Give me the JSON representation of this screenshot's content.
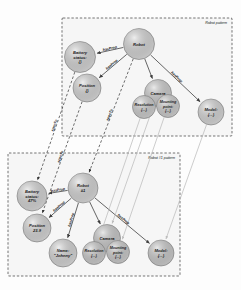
{
  "diagram": {
    "type": "graph",
    "title": "",
    "containers": [
      {
        "id": "pattern-robot",
        "label": "Robot pattern"
      },
      {
        "id": "pattern-robot1",
        "label": "Robot #1 pattern"
      }
    ],
    "nodes": [
      {
        "id": "robot",
        "container": "pattern-robot",
        "lines": [
          "Robot"
        ],
        "cx": 139,
        "cy": 44,
        "r": 15.5,
        "fill": "#d9d9d9"
      },
      {
        "id": "battery",
        "container": "pattern-robot",
        "lines": [
          "Battery",
          "status:",
          "{}"
        ],
        "cx": 80,
        "cy": 57,
        "r": 15.5,
        "fill": "#d9d9d9"
      },
      {
        "id": "position",
        "container": "pattern-robot",
        "lines": [
          "Position",
          "{}"
        ],
        "cx": 87,
        "cy": 88,
        "r": 14.0,
        "fill": "#d9d9d9"
      },
      {
        "id": "camera",
        "container": "pattern-robot",
        "lines": [
          "Camera"
        ],
        "cx": 158,
        "cy": 93,
        "r": 13.5,
        "fill": "#d0d0d0"
      },
      {
        "id": "resolution",
        "container": "pattern-robot",
        "lines": [
          "Resolution",
          "{...}"
        ],
        "cx": 144,
        "cy": 107,
        "r": 11.5,
        "fill": "#d0d0d0"
      },
      {
        "id": "mounting",
        "container": "pattern-robot",
        "lines": [
          "Mounting",
          "point:",
          "{...}"
        ],
        "cx": 168,
        "cy": 106,
        "r": 11.5,
        "fill": "#d0d0d0"
      },
      {
        "id": "model",
        "container": "pattern-robot",
        "lines": [
          "Model:",
          "{...}"
        ],
        "cx": 211,
        "cy": 112,
        "r": 13.0,
        "fill": "#d9d9d9"
      },
      {
        "id": "robot1",
        "container": "pattern-robot1",
        "lines": [
          "Robot",
          "#1"
        ],
        "cx": 83,
        "cy": 188,
        "r": 15.0,
        "fill": "#d9d9d9"
      },
      {
        "id": "battery1",
        "container": "pattern-robot1",
        "lines": [
          "Battery",
          "status:",
          "47%"
        ],
        "cx": 32,
        "cy": 196,
        "r": 15.0,
        "fill": "#d9d9d9"
      },
      {
        "id": "position1",
        "container": "pattern-robot1",
        "lines": [
          "Position",
          "23.9"
        ],
        "cx": 37,
        "cy": 228,
        "r": 14.0,
        "fill": "#d9d9d9"
      },
      {
        "id": "name1",
        "container": "pattern-robot1",
        "lines": [
          "Name:",
          "\"Johnny\""
        ],
        "cx": 63,
        "cy": 253,
        "r": 14.0,
        "fill": "#d9d9d9"
      },
      {
        "id": "camera1",
        "container": "pattern-robot1",
        "lines": [
          "Camera"
        ],
        "cx": 107,
        "cy": 238,
        "r": 13.5,
        "fill": "#cdcdcd"
      },
      {
        "id": "resolution1",
        "container": "pattern-robot1",
        "lines": [
          "Resolution",
          "{...}"
        ],
        "cx": 94,
        "cy": 253,
        "r": 11.5,
        "fill": "#cdcdcd"
      },
      {
        "id": "mounting1",
        "container": "pattern-robot1",
        "lines": [
          "Mounting",
          "point:",
          "{...}"
        ],
        "cx": 118,
        "cy": 252,
        "r": 11.5,
        "fill": "#cdcdcd"
      },
      {
        "id": "model1",
        "container": "pattern-robot1",
        "lines": [
          "Model:",
          "{...}"
        ],
        "cx": 161,
        "cy": 253,
        "r": 13.0,
        "fill": "#cdcdcd"
      }
    ],
    "edges": [
      {
        "from": "robot",
        "to": "battery",
        "label": "hasProp",
        "style": "solid"
      },
      {
        "from": "robot",
        "to": "position",
        "label": "hasProp",
        "style": "solid"
      },
      {
        "from": "robot",
        "to": "camera",
        "label": "",
        "style": "solid"
      },
      {
        "from": "robot",
        "to": "model",
        "label": "hasProp",
        "style": "solid"
      },
      {
        "from": "camera",
        "to": "resolution",
        "label": "",
        "style": "solid"
      },
      {
        "from": "camera",
        "to": "mounting",
        "label": "",
        "style": "solid"
      },
      {
        "from": "robot1",
        "to": "battery1",
        "label": "hasProp",
        "style": "solid"
      },
      {
        "from": "robot1",
        "to": "position1",
        "label": "hasProp",
        "style": "solid"
      },
      {
        "from": "robot1",
        "to": "name1",
        "label": "hasProp",
        "style": "solid"
      },
      {
        "from": "robot1",
        "to": "camera1",
        "label": "",
        "style": "solid"
      },
      {
        "from": "robot1",
        "to": "model1",
        "label": "hasProp",
        "style": "solid"
      },
      {
        "from": "camera1",
        "to": "resolution1",
        "label": "",
        "style": "solid"
      },
      {
        "from": "camera1",
        "to": "mounting1",
        "label": "",
        "style": "solid"
      },
      {
        "from": "robot",
        "to": "robot1",
        "label": "specTo",
        "style": "dashed"
      },
      {
        "from": "battery",
        "to": "battery1",
        "label": "specTo",
        "style": "dashed"
      },
      {
        "from": "position",
        "to": "position1",
        "label": "specTo",
        "style": "dashed"
      },
      {
        "from": "camera",
        "to": "camera1",
        "label": "",
        "style": "faint"
      },
      {
        "from": "resolution",
        "to": "resolution1",
        "label": "",
        "style": "faint"
      },
      {
        "from": "mounting",
        "to": "mounting1",
        "label": "",
        "style": "faint"
      },
      {
        "from": "model",
        "to": "model1",
        "label": "",
        "style": "faint"
      }
    ],
    "legend": {
      "relation_hasprop": "hasProp",
      "relation_specto": "specTo"
    }
  }
}
